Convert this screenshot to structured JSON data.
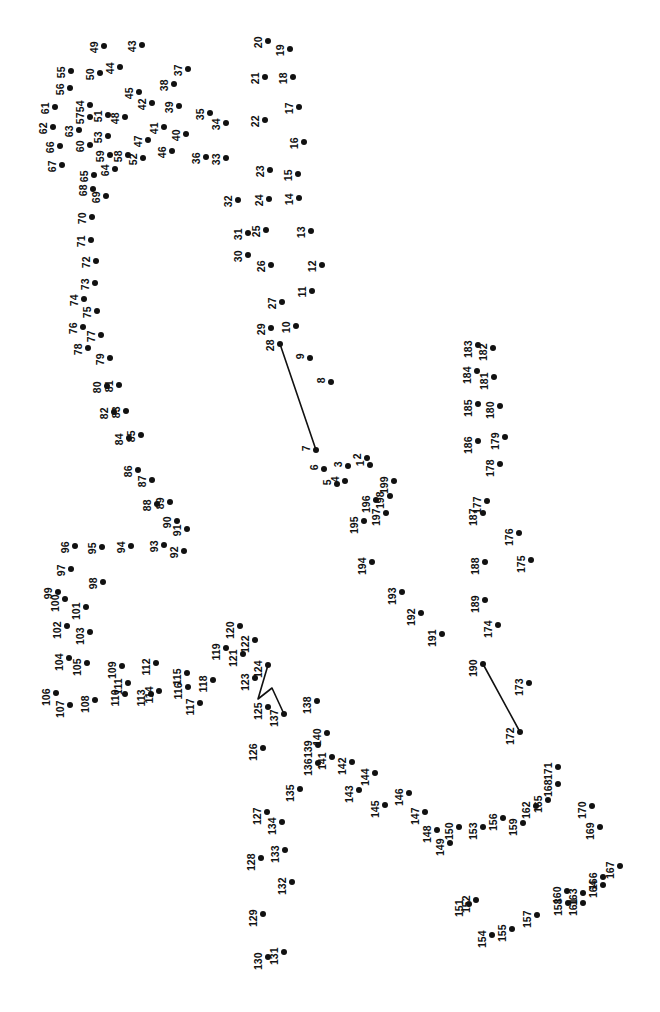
{
  "page": {
    "width": 660,
    "height": 1012,
    "background_color": "#ffffff",
    "ink_color": "#111111",
    "dot_radius": 3.0,
    "label_font_size": 10.5,
    "label_rotation_deg": -90,
    "dot_count": 199,
    "type": "connect-the-dots"
  },
  "chart_data": {
    "type": "scatter",
    "xlabel": "",
    "ylabel": "",
    "xlim": [
      0,
      660
    ],
    "ylim": [
      0,
      1012
    ],
    "grid": false,
    "legend": "none",
    "dots": [
      {
        "n": 1,
        "x": 370,
        "y": 465
      },
      {
        "n": 2,
        "x": 367,
        "y": 458
      },
      {
        "n": 3,
        "x": 348,
        "y": 466
      },
      {
        "n": 4,
        "x": 345,
        "y": 481
      },
      {
        "n": 5,
        "x": 337,
        "y": 484
      },
      {
        "n": 6,
        "x": 324,
        "y": 469
      },
      {
        "n": 7,
        "x": 316,
        "y": 450
      },
      {
        "n": 8,
        "x": 331,
        "y": 382
      },
      {
        "n": 9,
        "x": 310,
        "y": 358
      },
      {
        "n": 10,
        "x": 296,
        "y": 326
      },
      {
        "n": 11,
        "x": 312,
        "y": 291
      },
      {
        "n": 12,
        "x": 322,
        "y": 265
      },
      {
        "n": 13,
        "x": 311,
        "y": 231
      },
      {
        "n": 14,
        "x": 299,
        "y": 198
      },
      {
        "n": 15,
        "x": 298,
        "y": 174
      },
      {
        "n": 16,
        "x": 304,
        "y": 142
      },
      {
        "n": 17,
        "x": 299,
        "y": 107
      },
      {
        "n": 18,
        "x": 293,
        "y": 77
      },
      {
        "n": 19,
        "x": 290,
        "y": 49
      },
      {
        "n": 20,
        "x": 268,
        "y": 41
      },
      {
        "n": 21,
        "x": 265,
        "y": 77
      },
      {
        "n": 22,
        "x": 265,
        "y": 120
      },
      {
        "n": 23,
        "x": 270,
        "y": 170
      },
      {
        "n": 24,
        "x": 269,
        "y": 199
      },
      {
        "n": 25,
        "x": 266,
        "y": 230
      },
      {
        "n": 26,
        "x": 271,
        "y": 265
      },
      {
        "n": 27,
        "x": 282,
        "y": 302
      },
      {
        "n": 28,
        "x": 280,
        "y": 344
      },
      {
        "n": 29,
        "x": 271,
        "y": 328
      },
      {
        "n": 30,
        "x": 248,
        "y": 255
      },
      {
        "n": 31,
        "x": 248,
        "y": 233
      },
      {
        "n": 32,
        "x": 238,
        "y": 200
      },
      {
        "n": 33,
        "x": 226,
        "y": 158
      },
      {
        "n": 34,
        "x": 226,
        "y": 123
      },
      {
        "n": 35,
        "x": 210,
        "y": 113
      },
      {
        "n": 36,
        "x": 206,
        "y": 157
      },
      {
        "n": 37,
        "x": 188,
        "y": 69
      },
      {
        "n": 38,
        "x": 174,
        "y": 84
      },
      {
        "n": 39,
        "x": 179,
        "y": 106
      },
      {
        "n": 40,
        "x": 186,
        "y": 134
      },
      {
        "n": 41,
        "x": 164,
        "y": 127
      },
      {
        "n": 42,
        "x": 152,
        "y": 103
      },
      {
        "n": 43,
        "x": 142,
        "y": 45
      },
      {
        "n": 44,
        "x": 120,
        "y": 67
      },
      {
        "n": 45,
        "x": 139,
        "y": 92
      },
      {
        "n": 46,
        "x": 172,
        "y": 151
      },
      {
        "n": 47,
        "x": 148,
        "y": 140
      },
      {
        "n": 48,
        "x": 125,
        "y": 117
      },
      {
        "n": 49,
        "x": 104,
        "y": 46
      },
      {
        "n": 50,
        "x": 100,
        "y": 73
      },
      {
        "n": 51,
        "x": 108,
        "y": 115
      },
      {
        "n": 52,
        "x": 143,
        "y": 158
      },
      {
        "n": 53,
        "x": 108,
        "y": 136
      },
      {
        "n": 54,
        "x": 90,
        "y": 105
      },
      {
        "n": 55,
        "x": 71,
        "y": 71
      },
      {
        "n": 56,
        "x": 70,
        "y": 88
      },
      {
        "n": 57,
        "x": 90,
        "y": 117
      },
      {
        "n": 58,
        "x": 128,
        "y": 155
      },
      {
        "n": 59,
        "x": 110,
        "y": 155
      },
      {
        "n": 60,
        "x": 90,
        "y": 145
      },
      {
        "n": 61,
        "x": 55,
        "y": 107
      },
      {
        "n": 62,
        "x": 53,
        "y": 127
      },
      {
        "n": 63,
        "x": 79,
        "y": 130
      },
      {
        "n": 64,
        "x": 115,
        "y": 169
      },
      {
        "n": 65,
        "x": 94,
        "y": 175
      },
      {
        "n": 66,
        "x": 60,
        "y": 146
      },
      {
        "n": 67,
        "x": 62,
        "y": 165
      },
      {
        "n": 68,
        "x": 93,
        "y": 189
      },
      {
        "n": 69,
        "x": 106,
        "y": 196
      },
      {
        "n": 70,
        "x": 92,
        "y": 217
      },
      {
        "n": 71,
        "x": 91,
        "y": 240
      },
      {
        "n": 72,
        "x": 96,
        "y": 261
      },
      {
        "n": 73,
        "x": 95,
        "y": 283
      },
      {
        "n": 74,
        "x": 84,
        "y": 299
      },
      {
        "n": 75,
        "x": 97,
        "y": 311
      },
      {
        "n": 76,
        "x": 83,
        "y": 327
      },
      {
        "n": 77,
        "x": 101,
        "y": 335
      },
      {
        "n": 78,
        "x": 88,
        "y": 348
      },
      {
        "n": 79,
        "x": 110,
        "y": 358
      },
      {
        "n": 80,
        "x": 107,
        "y": 386
      },
      {
        "n": 81,
        "x": 119,
        "y": 385
      },
      {
        "n": 82,
        "x": 114,
        "y": 412
      },
      {
        "n": 83,
        "x": 126,
        "y": 411
      },
      {
        "n": 84,
        "x": 129,
        "y": 438
      },
      {
        "n": 85,
        "x": 141,
        "y": 435
      },
      {
        "n": 86,
        "x": 138,
        "y": 470
      },
      {
        "n": 87,
        "x": 152,
        "y": 480
      },
      {
        "n": 88,
        "x": 157,
        "y": 504
      },
      {
        "n": 89,
        "x": 170,
        "y": 502
      },
      {
        "n": 90,
        "x": 177,
        "y": 521
      },
      {
        "n": 91,
        "x": 187,
        "y": 529
      },
      {
        "n": 92,
        "x": 184,
        "y": 551
      },
      {
        "n": 93,
        "x": 164,
        "y": 545
      },
      {
        "n": 94,
        "x": 131,
        "y": 546
      },
      {
        "n": 95,
        "x": 102,
        "y": 547
      },
      {
        "n": 96,
        "x": 75,
        "y": 546
      },
      {
        "n": 97,
        "x": 71,
        "y": 569
      },
      {
        "n": 98,
        "x": 103,
        "y": 582
      },
      {
        "n": 99,
        "x": 58,
        "y": 592
      },
      {
        "n": 100,
        "x": 65,
        "y": 599
      },
      {
        "n": 101,
        "x": 86,
        "y": 607
      },
      {
        "n": 102,
        "x": 67,
        "y": 626
      },
      {
        "n": 103,
        "x": 90,
        "y": 632
      },
      {
        "n": 104,
        "x": 69,
        "y": 658
      },
      {
        "n": 105,
        "x": 87,
        "y": 663
      },
      {
        "n": 106,
        "x": 56,
        "y": 693
      },
      {
        "n": 107,
        "x": 70,
        "y": 705
      },
      {
        "n": 108,
        "x": 95,
        "y": 700
      },
      {
        "n": 109,
        "x": 122,
        "y": 666
      },
      {
        "n": 110,
        "x": 125,
        "y": 694
      },
      {
        "n": 111,
        "x": 128,
        "y": 683
      },
      {
        "n": 112,
        "x": 156,
        "y": 663
      },
      {
        "n": 113,
        "x": 151,
        "y": 694
      },
      {
        "n": 114,
        "x": 159,
        "y": 691
      },
      {
        "n": 115,
        "x": 187,
        "y": 673
      },
      {
        "n": 116,
        "x": 188,
        "y": 687
      },
      {
        "n": 117,
        "x": 200,
        "y": 703
      },
      {
        "n": 118,
        "x": 213,
        "y": 680
      },
      {
        "n": 119,
        "x": 226,
        "y": 648
      },
      {
        "n": 120,
        "x": 240,
        "y": 626
      },
      {
        "n": 121,
        "x": 243,
        "y": 654
      },
      {
        "n": 122,
        "x": 255,
        "y": 640
      },
      {
        "n": 123,
        "x": 255,
        "y": 678
      },
      {
        "n": 124,
        "x": 268,
        "y": 665
      },
      {
        "n": 125,
        "x": 268,
        "y": 707
      },
      {
        "n": 126,
        "x": 263,
        "y": 748
      },
      {
        "n": 127,
        "x": 267,
        "y": 812
      },
      {
        "n": 128,
        "x": 261,
        "y": 858
      },
      {
        "n": 129,
        "x": 263,
        "y": 914
      },
      {
        "n": 130,
        "x": 268,
        "y": 957
      },
      {
        "n": 131,
        "x": 284,
        "y": 952
      },
      {
        "n": 132,
        "x": 292,
        "y": 882
      },
      {
        "n": 133,
        "x": 285,
        "y": 850
      },
      {
        "n": 134,
        "x": 282,
        "y": 822
      },
      {
        "n": 135,
        "x": 300,
        "y": 789
      },
      {
        "n": 136,
        "x": 318,
        "y": 763
      },
      {
        "n": 137,
        "x": 284,
        "y": 714
      },
      {
        "n": 138,
        "x": 317,
        "y": 701
      },
      {
        "n": 139,
        "x": 318,
        "y": 745
      },
      {
        "n": 140,
        "x": 327,
        "y": 733
      },
      {
        "n": 141,
        "x": 332,
        "y": 757
      },
      {
        "n": 142,
        "x": 352,
        "y": 762
      },
      {
        "n": 143,
        "x": 359,
        "y": 790
      },
      {
        "n": 144,
        "x": 375,
        "y": 773
      },
      {
        "n": 145,
        "x": 385,
        "y": 805
      },
      {
        "n": 146,
        "x": 409,
        "y": 793
      },
      {
        "n": 147,
        "x": 425,
        "y": 812
      },
      {
        "n": 148,
        "x": 437,
        "y": 830
      },
      {
        "n": 149,
        "x": 450,
        "y": 843
      },
      {
        "n": 150,
        "x": 459,
        "y": 827
      },
      {
        "n": 151,
        "x": 469,
        "y": 904
      },
      {
        "n": 152,
        "x": 476,
        "y": 900
      },
      {
        "n": 153,
        "x": 483,
        "y": 827
      },
      {
        "n": 154,
        "x": 492,
        "y": 935
      },
      {
        "n": 155,
        "x": 512,
        "y": 929
      },
      {
        "n": 156,
        "x": 503,
        "y": 818
      },
      {
        "n": 157,
        "x": 537,
        "y": 915
      },
      {
        "n": 158,
        "x": 568,
        "y": 903
      },
      {
        "n": 159,
        "x": 523,
        "y": 823
      },
      {
        "n": 160,
        "x": 567,
        "y": 891
      },
      {
        "n": 161,
        "x": 583,
        "y": 903
      },
      {
        "n": 162,
        "x": 536,
        "y": 806
      },
      {
        "n": 163,
        "x": 583,
        "y": 893
      },
      {
        "n": 164,
        "x": 603,
        "y": 885
      },
      {
        "n": 165,
        "x": 548,
        "y": 800
      },
      {
        "n": 166,
        "x": 603,
        "y": 877
      },
      {
        "n": 167,
        "x": 620,
        "y": 866
      },
      {
        "n": 168,
        "x": 558,
        "y": 784
      },
      {
        "n": 169,
        "x": 600,
        "y": 827
      },
      {
        "n": 170,
        "x": 592,
        "y": 806
      },
      {
        "n": 171,
        "x": 558,
        "y": 767
      },
      {
        "n": 172,
        "x": 520,
        "y": 732
      },
      {
        "n": 173,
        "x": 529,
        "y": 683
      },
      {
        "n": 174,
        "x": 498,
        "y": 625
      },
      {
        "n": 175,
        "x": 531,
        "y": 560
      },
      {
        "n": 176,
        "x": 519,
        "y": 533
      },
      {
        "n": 177,
        "x": 487,
        "y": 501
      },
      {
        "n": 178,
        "x": 500,
        "y": 464
      },
      {
        "n": 179,
        "x": 505,
        "y": 437
      },
      {
        "n": 180,
        "x": 500,
        "y": 406
      },
      {
        "n": 181,
        "x": 494,
        "y": 377
      },
      {
        "n": 182,
        "x": 493,
        "y": 348
      },
      {
        "n": 183,
        "x": 478,
        "y": 345
      },
      {
        "n": 184,
        "x": 477,
        "y": 371
      },
      {
        "n": 185,
        "x": 478,
        "y": 404
      },
      {
        "n": 186,
        "x": 478,
        "y": 441
      },
      {
        "n": 187,
        "x": 483,
        "y": 513
      },
      {
        "n": 188,
        "x": 485,
        "y": 562
      },
      {
        "n": 189,
        "x": 485,
        "y": 600
      },
      {
        "n": 190,
        "x": 483,
        "y": 664
      },
      {
        "n": 191,
        "x": 442,
        "y": 634
      },
      {
        "n": 192,
        "x": 421,
        "y": 613
      },
      {
        "n": 193,
        "x": 402,
        "y": 592
      },
      {
        "n": 194,
        "x": 372,
        "y": 562
      },
      {
        "n": 195,
        "x": 364,
        "y": 521
      },
      {
        "n": 196,
        "x": 376,
        "y": 500
      },
      {
        "n": 197,
        "x": 386,
        "y": 513
      },
      {
        "n": 198,
        "x": 390,
        "y": 496
      },
      {
        "n": 199,
        "x": 394,
        "y": 481
      }
    ],
    "segments": [
      {
        "name": "segment-28-to-7",
        "points": [
          [
            280,
            344
          ],
          [
            316,
            450
          ]
        ]
      },
      {
        "name": "segment-190-to-172",
        "points": [
          [
            483,
            664
          ],
          [
            520,
            732
          ]
        ]
      },
      {
        "name": "segment-124-to-137",
        "points": [
          [
            268,
            665
          ],
          [
            258,
            699
          ],
          [
            272,
            688
          ],
          [
            284,
            714
          ]
        ]
      }
    ]
  }
}
